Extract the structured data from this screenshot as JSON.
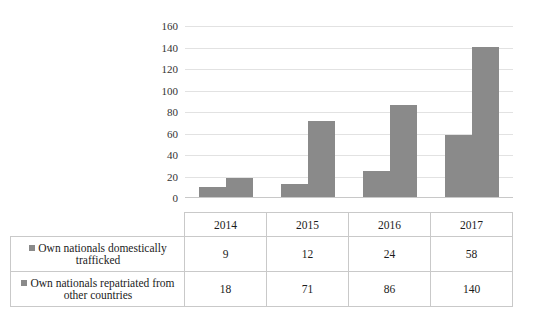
{
  "chart_data": {
    "type": "bar",
    "title": "",
    "xlabel": "",
    "ylabel": "",
    "categories": [
      "2014",
      "2015",
      "2016",
      "2017"
    ],
    "series": [
      {
        "name": "Own nationals domestically trafficked",
        "values": [
          9,
          12,
          24,
          58
        ],
        "color": "#8a8a8a"
      },
      {
        "name": "Own nationals repatriated from other countries",
        "values": [
          18,
          71,
          86,
          140
        ],
        "color": "#8a8a8a"
      }
    ],
    "ylim": [
      0,
      160
    ],
    "ytick_step": 20,
    "yticks": [
      "160",
      "140",
      "120",
      "100",
      "80",
      "60",
      "40",
      "20",
      "0"
    ],
    "grid": true,
    "legend_position": "data-table-first-column"
  },
  "table": {
    "header": [
      "",
      "2014",
      "2015",
      "2016",
      "2017"
    ],
    "rows": [
      {
        "label": "Own nationals domestically trafficked",
        "values": [
          "9",
          "12",
          "24",
          "58"
        ]
      },
      {
        "label": "Own nationals repatriated from other countries",
        "values": [
          "18",
          "71",
          "86",
          "140"
        ]
      }
    ]
  },
  "colors": {
    "bar": "#8a8a8a",
    "gridline": "#e2e2e2",
    "table_border": "#c9c9c9"
  }
}
